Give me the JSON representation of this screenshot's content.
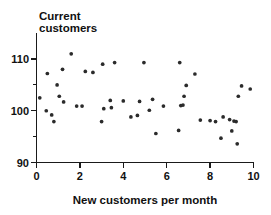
{
  "chart_data": {
    "type": "scatter",
    "title": "Current customers",
    "title_line1": "Current",
    "title_line2": "customers",
    "xlabel": "New customers per month",
    "ylabel": "Current customers",
    "xlim": [
      0,
      10
    ],
    "ylim": [
      90,
      113
    ],
    "xticks": [
      0,
      2,
      4,
      6,
      8,
      10
    ],
    "xtick_labels": [
      "0",
      "2",
      "4",
      "6",
      "8",
      "10"
    ],
    "yticks": [
      90,
      100,
      110
    ],
    "ytick_labels": [
      "90",
      "100",
      "110"
    ],
    "yminorticks": [
      95,
      105
    ],
    "grid": false,
    "legend": false,
    "marker_color": "#2b2b2b",
    "axis_color": "#1a1a1a",
    "points": [
      {
        "x": 0.15,
        "y": 102.5
      },
      {
        "x": 0.45,
        "y": 100.0
      },
      {
        "x": 0.5,
        "y": 107.2
      },
      {
        "x": 0.7,
        "y": 99.2
      },
      {
        "x": 0.8,
        "y": 97.9
      },
      {
        "x": 0.95,
        "y": 105.0
      },
      {
        "x": 1.05,
        "y": 102.8
      },
      {
        "x": 1.2,
        "y": 108.0
      },
      {
        "x": 1.25,
        "y": 101.7
      },
      {
        "x": 1.6,
        "y": 111.0
      },
      {
        "x": 1.85,
        "y": 100.9
      },
      {
        "x": 2.1,
        "y": 100.9
      },
      {
        "x": 2.25,
        "y": 107.6
      },
      {
        "x": 2.6,
        "y": 107.4
      },
      {
        "x": 3.0,
        "y": 97.9
      },
      {
        "x": 3.05,
        "y": 109.0
      },
      {
        "x": 3.1,
        "y": 100.4
      },
      {
        "x": 3.4,
        "y": 102.0
      },
      {
        "x": 3.45,
        "y": 100.6
      },
      {
        "x": 3.6,
        "y": 109.3
      },
      {
        "x": 4.0,
        "y": 101.9
      },
      {
        "x": 4.35,
        "y": 98.8
      },
      {
        "x": 4.65,
        "y": 99.1
      },
      {
        "x": 4.75,
        "y": 101.8
      },
      {
        "x": 4.95,
        "y": 109.3
      },
      {
        "x": 5.2,
        "y": 100.1
      },
      {
        "x": 5.35,
        "y": 102.2
      },
      {
        "x": 5.5,
        "y": 95.6
      },
      {
        "x": 5.85,
        "y": 100.9
      },
      {
        "x": 6.55,
        "y": 96.2
      },
      {
        "x": 6.6,
        "y": 109.3
      },
      {
        "x": 6.65,
        "y": 101.0
      },
      {
        "x": 6.75,
        "y": 101.1
      },
      {
        "x": 6.8,
        "y": 102.8
      },
      {
        "x": 6.9,
        "y": 104.9
      },
      {
        "x": 7.3,
        "y": 107.1
      },
      {
        "x": 7.55,
        "y": 98.2
      },
      {
        "x": 8.0,
        "y": 98.1
      },
      {
        "x": 8.25,
        "y": 97.9
      },
      {
        "x": 8.5,
        "y": 94.7
      },
      {
        "x": 8.6,
        "y": 98.8
      },
      {
        "x": 8.9,
        "y": 98.3
      },
      {
        "x": 9.0,
        "y": 96.1
      },
      {
        "x": 9.1,
        "y": 98.0
      },
      {
        "x": 9.2,
        "y": 97.9
      },
      {
        "x": 9.25,
        "y": 93.6
      },
      {
        "x": 9.3,
        "y": 102.8
      },
      {
        "x": 9.45,
        "y": 104.8
      },
      {
        "x": 9.85,
        "y": 104.2
      }
    ]
  }
}
